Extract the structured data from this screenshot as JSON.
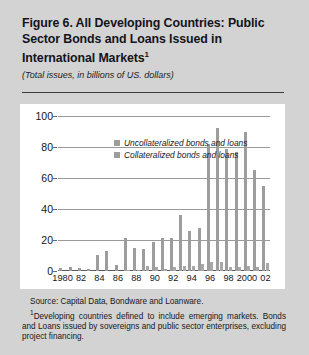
{
  "figure": {
    "title_line1": "Figure 6. All Developing Countries: Public",
    "title_line2": "Sector Bonds and Loans Issued in",
    "title_line3": "International Markets",
    "title_footnote_marker": "1",
    "subtitle": "(Total issues, in billions of US. dollars)"
  },
  "footer": {
    "source": "Source: Capital Data, Bondware and Loanware.",
    "note_marker": "1",
    "note": "Developing countries defined to include emerging markets. Bonds and Loans issued by sovereigns and public sector enterprises, excluding project financing."
  },
  "colors": {
    "page_background": "#d3d3d3",
    "panel_background": "#ffffff",
    "bar_uncollateralized": "#9d9d9d",
    "bar_collateralized": "#a8a8a8",
    "gridline": "#9a9a9a",
    "text": "#15151a"
  },
  "chart_data": {
    "type": "bar",
    "title": "Figure 6. All Developing Countries: Public Sector Bonds and Loans Issued in International Markets",
    "subtitle": "(Total issues, in billions of US. dollars)",
    "xlabel": "",
    "ylabel": "",
    "ylim": [
      0,
      100
    ],
    "yticks": [
      0,
      20,
      40,
      60,
      80,
      100
    ],
    "grid": true,
    "legend_position": "top-left",
    "categories": [
      "1980",
      "1981",
      "1982",
      "1983",
      "1984",
      "1985",
      "1986",
      "1987",
      "1988",
      "1989",
      "1990",
      "1991",
      "1992",
      "1993",
      "1994",
      "1995",
      "1996",
      "1997",
      "1998",
      "1999",
      "2000",
      "2001",
      "2002"
    ],
    "xtick_labels": [
      "1980",
      "82",
      "84",
      "86",
      "88",
      "90",
      "92",
      "94",
      "96",
      "98",
      "2000",
      "02"
    ],
    "xtick_categories": [
      "1980",
      "1982",
      "1984",
      "1986",
      "1988",
      "1990",
      "1992",
      "1994",
      "1996",
      "1998",
      "2000",
      "2002"
    ],
    "series": [
      {
        "name": "Uncollateralized bonds and loans",
        "color": "#9d9d9d",
        "values": [
          2,
          2.5,
          2,
          1.5,
          10.5,
          13,
          4,
          21,
          15,
          14.5,
          18.5,
          21,
          21.5,
          36,
          26,
          28,
          82,
          92,
          79,
          77,
          90,
          65,
          55
        ]
      },
      {
        "name": "Collateralized bonds and loans",
        "color": "#a8a8a8",
        "values": [
          0,
          0,
          0,
          0,
          0,
          0,
          0,
          0.5,
          0.5,
          3.5,
          2.5,
          1.5,
          2.5,
          3,
          3.5,
          4.5,
          5.5,
          6,
          2.5,
          2.5,
          3,
          2.5,
          5
        ]
      }
    ]
  }
}
